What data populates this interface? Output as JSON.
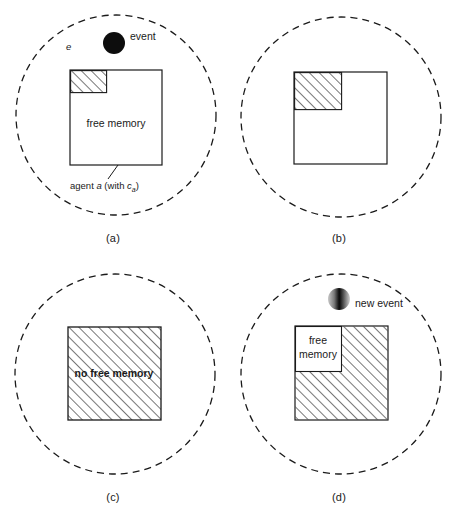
{
  "figure": {
    "type": "diagram",
    "background_color": "#ffffff",
    "line_color": "#1a1a1a",
    "hatch_color": "#555555"
  },
  "panels": [
    {
      "id": "a",
      "caption": "(a)",
      "environment_label": "e",
      "event_label": "event",
      "event_style": "solid-black",
      "box_label": "free memory",
      "agent_label_prefix": "agent ",
      "agent_label_italic": "a",
      "agent_label_mid": " (with ",
      "agent_label_var": "c",
      "agent_label_sub": "a",
      "agent_label_suffix": ")",
      "used_fraction_w": 0.39,
      "used_fraction_h": 0.23
    },
    {
      "id": "b",
      "caption": "(b)",
      "used_fraction_w": 0.5,
      "used_fraction_h": 0.4
    },
    {
      "id": "c",
      "caption": "(c)",
      "box_label": "no free memory",
      "used_fraction_w": 1.0,
      "used_fraction_h": 1.0
    },
    {
      "id": "d",
      "caption": "(d)",
      "event_label": "new event",
      "event_style": "gradient-half",
      "box_label_line1": "free",
      "box_label_line2": "memory",
      "free_fraction_w": 0.5,
      "free_fraction_h": 0.48
    }
  ]
}
